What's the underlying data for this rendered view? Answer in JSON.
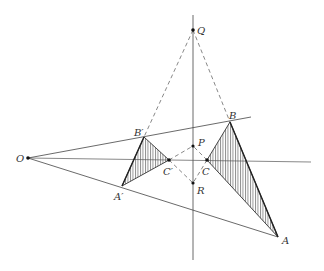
{
  "diagram": {
    "type": "geometry-construction",
    "colors": {
      "line": "#333333",
      "hatch": "#555555",
      "background": "#ffffff"
    },
    "points": {
      "O": {
        "label": "O",
        "x": 28,
        "y": 158
      },
      "Q": {
        "label": "Q",
        "x": 193,
        "y": 30
      },
      "P": {
        "label": "P",
        "x": 193,
        "y": 146
      },
      "R": {
        "label": "R",
        "x": 193,
        "y": 183
      },
      "B": {
        "label": "B",
        "x": 230,
        "y": 122
      },
      "B2": {
        "label": "B′",
        "x": 144,
        "y": 137
      },
      "C": {
        "label": "C",
        "x": 207,
        "y": 160
      },
      "C2": {
        "label": "C′",
        "x": 169,
        "y": 160
      },
      "A": {
        "label": "A",
        "x": 278,
        "y": 237
      },
      "A2": {
        "label": "A′",
        "x": 122,
        "y": 186
      }
    },
    "triangles": [
      {
        "name": "ABC",
        "vertices": [
          "A",
          "B",
          "C"
        ],
        "hatched": true
      },
      {
        "name": "A′B′C′",
        "vertices": [
          "A2",
          "B2",
          "C2"
        ],
        "hatched": true
      }
    ],
    "solid_lines": [
      [
        "O",
        "B-ext"
      ],
      [
        "O",
        "horizontal-ext"
      ],
      [
        "O",
        "A"
      ],
      [
        "axis-top",
        "axis-bottom"
      ]
    ],
    "dashed_lines": [
      [
        "Q",
        "B2"
      ],
      [
        "Q",
        "B"
      ],
      [
        "C2",
        "P"
      ],
      [
        "C2",
        "R"
      ],
      [
        "C",
        "P"
      ],
      [
        "C",
        "R"
      ]
    ]
  }
}
